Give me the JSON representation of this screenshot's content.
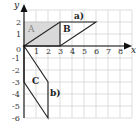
{
  "diagram": {
    "type": "coordinate-grid-transformations",
    "axes": {
      "x_label": "x",
      "y_label": "y",
      "x_ticks": [
        "0",
        "1",
        "2",
        "3",
        "4",
        "5",
        "6",
        "7",
        "8"
      ],
      "y_ticks_positive": [
        "1",
        "2"
      ],
      "y_ticks_negative": [
        "-1",
        "-2",
        "-3",
        "-4",
        "-5",
        "-6"
      ],
      "x_range": [
        0,
        9
      ],
      "y_range": [
        -6,
        3
      ]
    },
    "shapes": [
      {
        "name": "A",
        "label": "A",
        "kind": "rectangle",
        "vertices": [
          [
            0,
            0
          ],
          [
            3,
            0
          ],
          [
            3,
            2
          ],
          [
            0,
            2
          ]
        ],
        "fill": "#d9d9d9",
        "shaded": true
      },
      {
        "name": "B",
        "label": "B",
        "kind": "parallelogram",
        "vertices": [
          [
            0,
            0
          ],
          [
            3,
            0
          ],
          [
            6,
            2
          ],
          [
            3,
            2
          ]
        ]
      },
      {
        "name": "C",
        "label": "C",
        "kind": "parallelogram",
        "vertices": [
          [
            0,
            0
          ],
          [
            2,
            -3
          ],
          [
            2,
            -6
          ],
          [
            0,
            -3
          ]
        ]
      }
    ],
    "annotations": [
      {
        "text": "a)",
        "at": [
          4.3,
          2.5
        ]
      },
      {
        "text": "b)",
        "at": [
          2.2,
          -4.1
        ]
      }
    ],
    "colors": {
      "grid": "#cfcfcf",
      "axis": "#111111",
      "shape_line": "#222222",
      "shade": "#d9d9d9"
    }
  }
}
